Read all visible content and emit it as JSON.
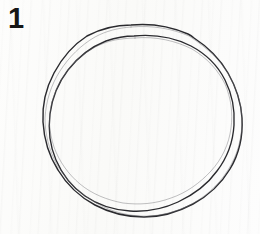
{
  "figure": {
    "number_label": "1",
    "caption": "",
    "background_color": "#fcfcfb",
    "ink_color": "#2a2a2e",
    "width_px": 260,
    "height_px": 234
  },
  "drawing": {
    "type": "line-drawing",
    "subject": "hand-drawn double ring (annulus) outline",
    "stroke_count": 2,
    "strokes": [
      {
        "name": "outer-ring",
        "closed": true,
        "center_x": 142,
        "center_y": 118,
        "radius_x": 99,
        "radius_y": 97,
        "stroke_width": 1.45
      },
      {
        "name": "inner-ring",
        "closed": true,
        "center_x": 144,
        "center_y": 121,
        "radius_x": 88,
        "radius_y": 86,
        "stroke_width": 1.35
      }
    ]
  }
}
